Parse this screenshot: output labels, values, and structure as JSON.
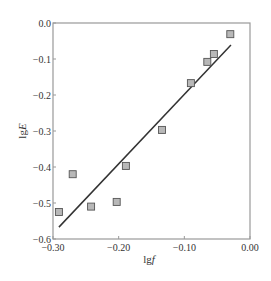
{
  "chart_data": {
    "type": "scatter",
    "title": "",
    "xlabel": "lg f",
    "ylabel": "lg E",
    "xlabel_parts": {
      "prefix": "lg",
      "var": "f"
    },
    "ylabel_parts": {
      "prefix": "lg",
      "var": "E"
    },
    "xlim": [
      -0.3,
      0.0
    ],
    "ylim": [
      -0.6,
      0.0
    ],
    "xticks": [
      -0.3,
      -0.2,
      -0.1,
      0.0
    ],
    "xtick_labels": [
      "−0.30",
      "−0.20",
      "−0.10",
      "0.00"
    ],
    "yticks": [
      0.0,
      -0.1,
      -0.2,
      -0.3,
      -0.4,
      -0.5,
      -0.6
    ],
    "ytick_labels": [
      "0.0",
      "−0.1",
      "−0.2",
      "−0.3",
      "−0.4",
      "−0.5",
      "−0.6"
    ],
    "grid": false,
    "legend": null,
    "series": [
      {
        "name": "measured",
        "marker": "square",
        "marker_fill": "#b8b8b8",
        "marker_edge": "#555555",
        "x": [
          -0.291,
          -0.27,
          -0.242,
          -0.203,
          -0.189,
          -0.134,
          -0.09,
          -0.065,
          -0.055,
          -0.03
        ],
        "y": [
          -0.525,
          -0.42,
          -0.51,
          -0.497,
          -0.397,
          -0.297,
          -0.167,
          -0.108,
          -0.086,
          -0.031
        ]
      },
      {
        "name": "linear fit",
        "type": "line",
        "color": "#333333",
        "x": [
          -0.291,
          -0.029
        ],
        "y": [
          -0.567,
          -0.061
        ]
      }
    ]
  },
  "colors": {
    "frame": "#999999",
    "text": "#333333",
    "fit_line": "#333333"
  }
}
